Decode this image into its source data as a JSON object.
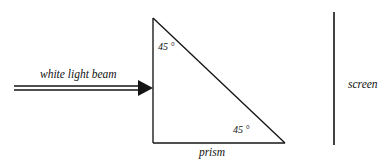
{
  "figure": {
    "kind": "optics-ray-diagram",
    "background_color": "#ffffff",
    "ink_color": "#141414",
    "width": 389,
    "height": 162
  },
  "prism": {
    "label": "prism",
    "shape": "right-triangle",
    "vertices": {
      "apex": [
        153,
        18
      ],
      "bottom_left": [
        153,
        143
      ],
      "bottom_right": [
        285,
        143
      ]
    },
    "angles": [
      {
        "name": "top-angle",
        "label": "45 °",
        "value": 45,
        "unit": "degree",
        "x": 158,
        "y": 50
      },
      {
        "name": "bottom-right-angle",
        "label": "45 °",
        "value": 45,
        "unit": "degree",
        "x": 233,
        "y": 133
      }
    ],
    "label_position": {
      "x": 212,
      "y": 156
    }
  },
  "beam": {
    "label": "white light beam",
    "direction": "left-to-right",
    "style": "double-line-with-arrowhead",
    "start_x": 14,
    "tip_x": 153,
    "axis_y": 88,
    "line_gap": 4,
    "label_position": {
      "x": 40,
      "y": 78
    }
  },
  "screen": {
    "label": "screen",
    "x": 334,
    "y_top": 12,
    "y_bottom": 145,
    "label_position": {
      "x": 348,
      "y": 88
    }
  }
}
